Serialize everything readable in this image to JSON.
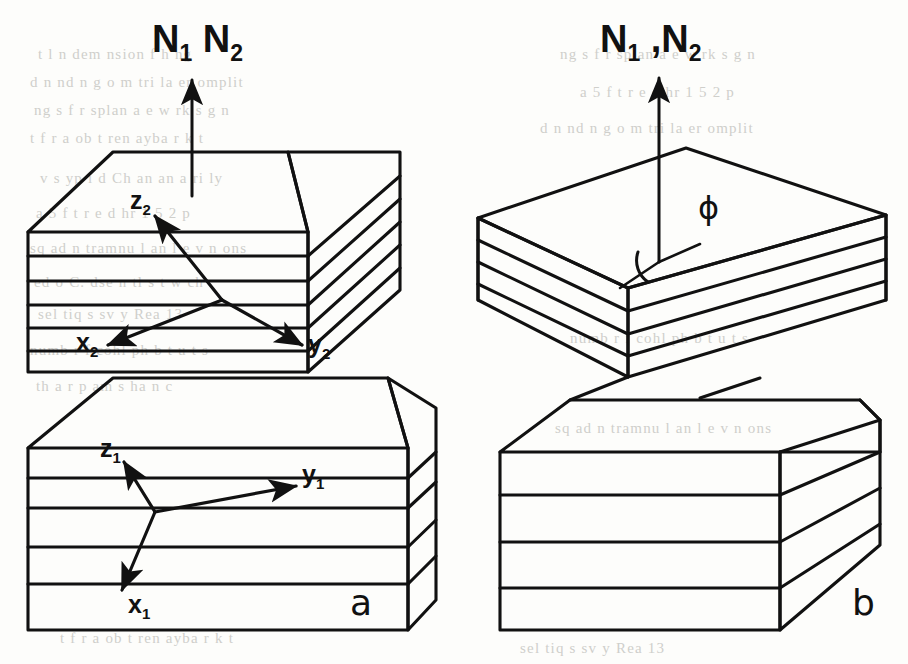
{
  "figure": {
    "title_left": "a",
    "title_right": "b",
    "panels": [
      {
        "id": "a",
        "label": "a",
        "normal_label_html": "N<sub>1</sub> N<sub>2</sub>",
        "normal_label_text": "N1 N2",
        "description": "Two stacked layered blocks with coincident layer normals; local coordinate axes drawn on each block",
        "blocks": [
          {
            "name": "upper-block",
            "axes": [
              "z2",
              "x2",
              "y2"
            ],
            "layer_count": 6
          },
          {
            "name": "lower-block",
            "axes": [
              "z1",
              "y1",
              "x1"
            ],
            "layer_count": 5
          }
        ]
      },
      {
        "id": "b",
        "label": "b",
        "normal_label_html": "N<sub>1</sub> ,N<sub>2</sub>",
        "normal_label_text": "N1 ,N2",
        "angle_label": "ϕ",
        "description": "Two stacked layered blocks, the upper one rotated about the common normal by the twist angle phi",
        "blocks": [
          {
            "name": "upper-block",
            "layer_count": 6,
            "rotated": true
          },
          {
            "name": "lower-block",
            "layer_count": 5,
            "rotated": false
          }
        ]
      }
    ],
    "axis_labels": {
      "z2": {
        "base": "z",
        "sub": "2"
      },
      "x2": {
        "base": "x",
        "sub": "2"
      },
      "y2": {
        "base": "y",
        "sub": "2"
      },
      "z1": {
        "base": "z",
        "sub": "1"
      },
      "x1": {
        "base": "x",
        "sub": "1"
      },
      "y1": {
        "base": "y",
        "sub": "1"
      }
    },
    "colors": {
      "ink": "#111111",
      "paper": "#fdfdfb",
      "bleed": "#cfcfcb"
    },
    "bleed_text": [
      "t l  n dem nsion f h      ng",
      "d n   nd  n  g o m tri   la er   omplit",
      "ng s   f   r    splan a e   w rk   s  g n",
      "t  f    r  a ob t  ren  ayba    r    k   t",
      "v   s  yp    i    d   Ch an    an  a  ri ly",
      "a 5 f  t    r  e   d hr    1  5 2 p",
      "sq ad  n  tramnu  l   an  l   e  v n  ons",
      "ed   o   C. dse  n  tl   s  t      w  ch",
      "sel  tiq  s  sv  y    Rea  13 ",
      "numb r   f  cohl   ph   b   t     u    t s",
      "th a   r   p   am  s    ha n     c"
    ]
  }
}
